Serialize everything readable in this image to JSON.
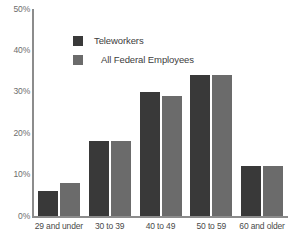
{
  "chart_data": {
    "type": "bar",
    "title": "",
    "subtitle": "",
    "xlabel": "",
    "ylabel": "",
    "grid": false,
    "legend_position": "top-center",
    "categories": [
      "29 and under",
      "30 to 39",
      "40 to 49",
      "50 to 59",
      "60 and older"
    ],
    "series": [
      {
        "name": "Teleworkers",
        "color": "#393939",
        "values": [
          6,
          18,
          30,
          34,
          12
        ]
      },
      {
        "name": "All Federal Employees",
        "color": "#6b6b6b",
        "values": [
          8,
          18,
          29,
          34,
          12
        ]
      }
    ],
    "ylim": [
      0,
      50
    ],
    "yticks": [
      0,
      10,
      20,
      30,
      40,
      50
    ],
    "ytick_labels": [
      "0%",
      "10%",
      "20%",
      "30%",
      "40%",
      "50%"
    ],
    "value_suffix": "%"
  },
  "axis": {
    "y_labels": [
      "50%",
      "40%",
      "30%",
      "20%",
      "10%",
      "0%"
    ]
  },
  "legend": {
    "items": [
      {
        "label": "Teleworkers",
        "color": "#393939"
      },
      {
        "label": "All Federal Employees",
        "color": "#6b6b6b"
      }
    ]
  },
  "colors": {
    "series_dark": "#393939",
    "series_light": "#6b6b6b",
    "axis": "#8c8c8c",
    "tick_text": "#6d6d6d",
    "category_text": "#4a4a4a",
    "background": "#ffffff"
  }
}
